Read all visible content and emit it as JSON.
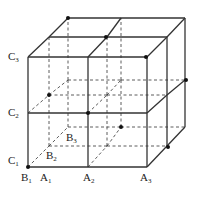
{
  "figure": {
    "line_color": "#333333",
    "dot_color": "#111111",
    "grid": {
      "front": {
        "x": [
          28,
          88,
          147
        ],
        "y": [
          57,
          113,
          167
        ]
      },
      "mid": {
        "x": [
          49,
          107,
          167
        ],
        "y": [
          37,
          95,
          146
        ]
      },
      "back": {
        "x": [
          68,
          121,
          185
        ],
        "y": [
          18,
          80,
          127
        ]
      }
    },
    "labels": [
      {
        "id": "C3",
        "base": "C",
        "sub": "3",
        "x": 8,
        "y": 51
      },
      {
        "id": "C2",
        "base": "C",
        "sub": "2",
        "x": 8,
        "y": 107
      },
      {
        "id": "C1",
        "base": "C",
        "sub": "1",
        "x": 8,
        "y": 155
      },
      {
        "id": "B1",
        "base": "B",
        "sub": "1",
        "x": 21,
        "y": 172
      },
      {
        "id": "B2",
        "base": "B",
        "sub": "2",
        "x": 46,
        "y": 150
      },
      {
        "id": "B3",
        "base": "B",
        "sub": "3",
        "x": 66,
        "y": 132
      },
      {
        "id": "A1",
        "base": "A",
        "sub": "1",
        "x": 40,
        "y": 172
      },
      {
        "id": "A2",
        "base": "A",
        "sub": "2",
        "x": 83,
        "y": 172
      },
      {
        "id": "A3",
        "base": "A",
        "sub": "3",
        "x": 140,
        "y": 172
      }
    ],
    "dots": [
      {
        "x": 68,
        "y": 18
      },
      {
        "x": 106,
        "y": 37
      },
      {
        "x": 146,
        "y": 57
      },
      {
        "x": 186,
        "y": 80
      },
      {
        "x": 49,
        "y": 95
      },
      {
        "x": 88,
        "y": 113
      },
      {
        "x": 121,
        "y": 127
      },
      {
        "x": 168,
        "y": 147
      },
      {
        "x": 28,
        "y": 167
      }
    ]
  }
}
